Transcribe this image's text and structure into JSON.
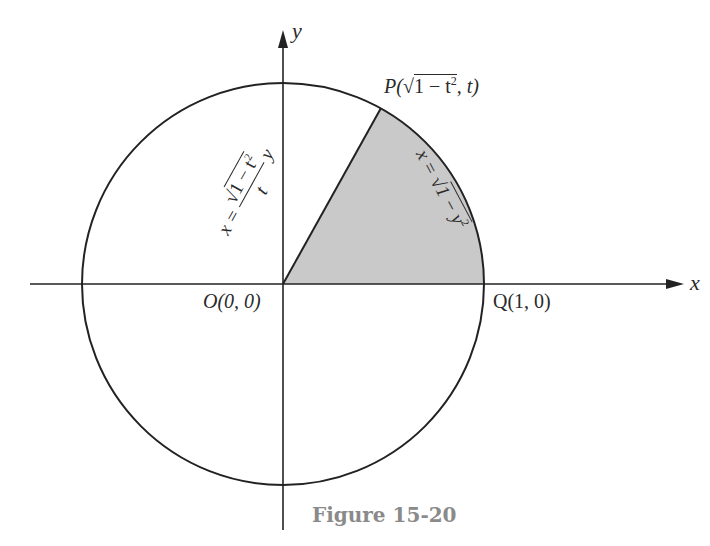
{
  "figure": {
    "caption": "Figure 15-20",
    "axes": {
      "x_label": "x",
      "y_label": "y"
    },
    "points": {
      "origin": "O(0, 0)",
      "Q": "Q(1, 0)",
      "P_prefix": "P(",
      "P_radicand": "1 − t",
      "P_exp": "2",
      "P_suffix": ", t)"
    },
    "curves": {
      "line_label_prefix": "x = ",
      "line_num": "1 − t",
      "line_num_exp": "2",
      "line_den": "t",
      "line_y": "y",
      "arc_label_prefix": "x = ",
      "arc_radicand": "1 − y",
      "arc_exp": "2"
    },
    "colors": {
      "stroke": "#222222",
      "shaded_region": "#c9c9c9",
      "caption": "#8a8a8a"
    }
  }
}
